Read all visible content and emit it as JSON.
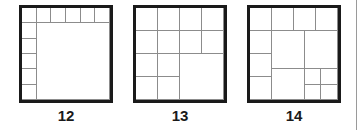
{
  "figures": [
    {
      "label": "12",
      "left": 19,
      "cells": [
        [
          0,
          0,
          0.1667,
          0.1667
        ],
        [
          0.1667,
          0,
          0.1667,
          0.1667
        ],
        [
          0.3333,
          0,
          0.1667,
          0.1667
        ],
        [
          0.5,
          0,
          0.1667,
          0.1667
        ],
        [
          0.6667,
          0,
          0.1667,
          0.1667
        ],
        [
          0.8333,
          0,
          0.1667,
          0.1667
        ],
        [
          0,
          0.1667,
          0.1667,
          0.1667
        ],
        [
          0,
          0.3333,
          0.1667,
          0.1667
        ],
        [
          0,
          0.5,
          0.1667,
          0.1667
        ],
        [
          0,
          0.6667,
          0.1667,
          0.1667
        ],
        [
          0,
          0.8333,
          0.1667,
          0.1667
        ],
        [
          0.1667,
          0.1667,
          0.8333,
          0.8333
        ]
      ]
    },
    {
      "label": "13",
      "left": 133,
      "cells": [
        [
          0,
          0,
          0.25,
          0.25
        ],
        [
          0.25,
          0,
          0.25,
          0.25
        ],
        [
          0.5,
          0,
          0.25,
          0.25
        ],
        [
          0.75,
          0,
          0.25,
          0.25
        ],
        [
          0,
          0.25,
          0.25,
          0.25
        ],
        [
          0.25,
          0.25,
          0.25,
          0.25
        ],
        [
          0.5,
          0.25,
          0.25,
          0.25
        ],
        [
          0.75,
          0.25,
          0.25,
          0.25
        ],
        [
          0,
          0.5,
          0.25,
          0.25
        ],
        [
          0.25,
          0.5,
          0.25,
          0.25
        ],
        [
          0,
          0.75,
          0.25,
          0.25
        ],
        [
          0.25,
          0.75,
          0.25,
          0.25
        ],
        [
          0.5,
          0.5,
          0.5,
          0.5
        ]
      ]
    },
    {
      "label": "14",
      "left": 247,
      "cells": [
        [
          0,
          0,
          0.25,
          0.25
        ],
        [
          0.25,
          0,
          0.25,
          0.25
        ],
        [
          0.5,
          0,
          0.25,
          0.25
        ],
        [
          0.75,
          0,
          0.25,
          0.25
        ],
        [
          0,
          0.25,
          0.25,
          0.25
        ],
        [
          0,
          0.5,
          0.25,
          0.25
        ],
        [
          0,
          0.75,
          0.25,
          0.25
        ],
        [
          0.25,
          0.25,
          0.37,
          0.415
        ],
        [
          0.62,
          0.25,
          0.38,
          0.415
        ],
        [
          0.25,
          0.665,
          0.37,
          0.335
        ],
        [
          0.62,
          0.665,
          0.19,
          0.1675
        ],
        [
          0.81,
          0.665,
          0.19,
          0.1675
        ],
        [
          0.62,
          0.8325,
          0.19,
          0.1675
        ],
        [
          0.81,
          0.8325,
          0.19,
          0.1675
        ]
      ]
    }
  ]
}
